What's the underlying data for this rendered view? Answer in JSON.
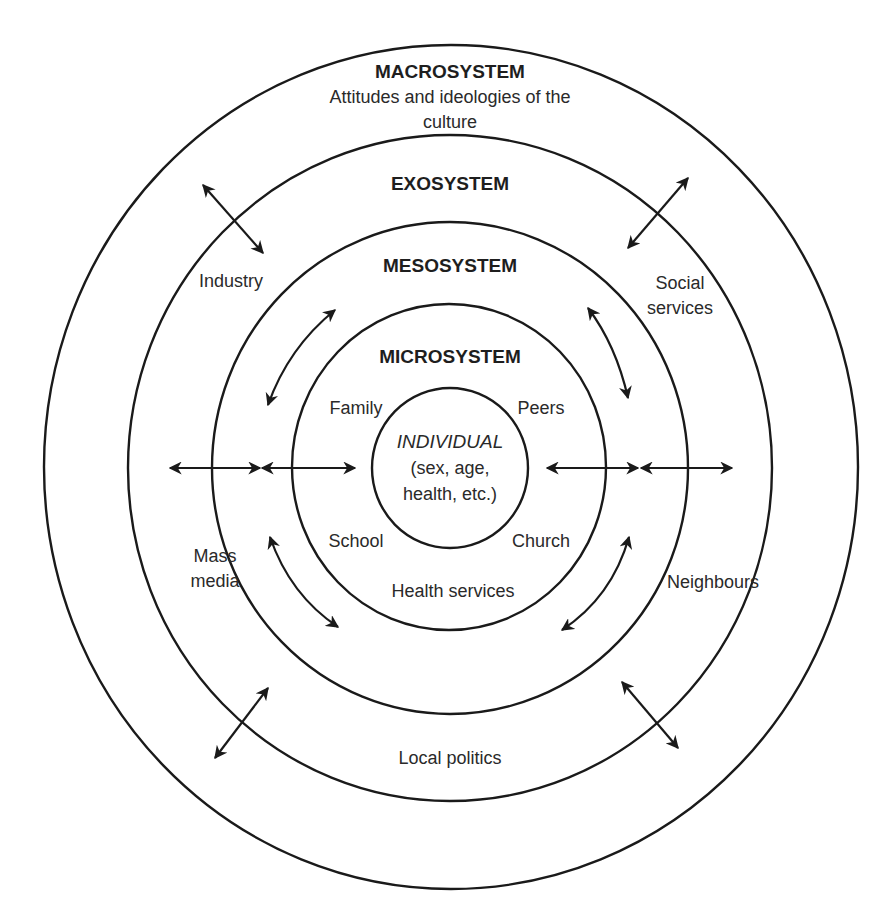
{
  "diagram": {
    "systems": {
      "macro": {
        "label": "MACROSYSTEM",
        "description_line1": "Attitudes and ideologies of the",
        "description_line2": "culture",
        "items": [
          "Industry",
          "Social services",
          "Mass media",
          "Neighbours",
          "Local politics"
        ]
      },
      "exo": {
        "label": "EXOSYSTEM"
      },
      "meso": {
        "label": "MESOSYSTEM"
      },
      "micro": {
        "label": "MICROSYSTEM",
        "items": [
          "Family",
          "Peers",
          "School",
          "Church",
          "Health services"
        ]
      },
      "individual": {
        "label": "INDIVIDUAL",
        "line2": "(sex, age,",
        "line3": "health, etc.)"
      }
    },
    "exo_items": {
      "industry": "Industry",
      "social_line1": "Social",
      "social_line2": "services",
      "mass_line1": "Mass",
      "mass_line2": "media",
      "neighbours": "Neighbours",
      "local_politics": "Local politics"
    },
    "micro_items": {
      "family": "Family",
      "peers": "Peers",
      "school": "School",
      "church": "Church",
      "health_services": "Health services"
    },
    "arrow_type": "bidirectional",
    "colors": {
      "line": "#1a1a1a",
      "text": "#2a2a2a",
      "background": "#ffffff"
    }
  }
}
